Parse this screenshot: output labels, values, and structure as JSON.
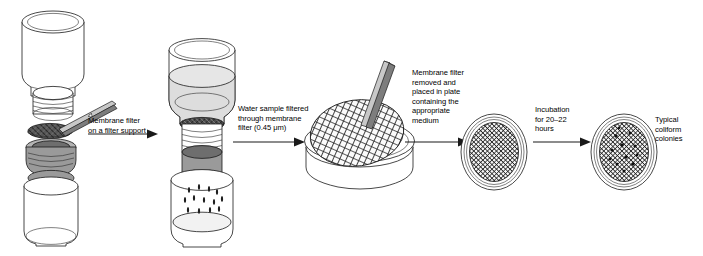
{
  "figure": {
    "background_color": "#ffffff",
    "ink_color": "#1a1a1a"
  },
  "labels": [
    {
      "id": "step-1-label",
      "text": "Membrane filter\non a filter support",
      "x": 88,
      "y": 116
    },
    {
      "id": "step-2-label",
      "text": "Water sample filtered\nthrough membrane\nfilter (0.45 μm)",
      "x": 238,
      "y": 104
    },
    {
      "id": "step-3-label",
      "text": "Membrane filter\nremoved and\nplaced in plate\ncontaining the\nappropriate\nmedium",
      "x": 412,
      "y": 68
    },
    {
      "id": "step-4-label",
      "text": "Incubation\nfor 20–22\nhours",
      "x": 535,
      "y": 105
    },
    {
      "id": "step-5-label",
      "text": "Typical\ncoliform\ncolonies",
      "x": 655,
      "y": 115
    }
  ],
  "stages": [
    {
      "id": "filtration-assembly-disassembled",
      "name": "Filter funnel, membrane filter and receiving flask, separated",
      "parts": [
        "upper-funnel",
        "threaded-neck",
        "membrane-filter-disc",
        "forceps",
        "filter-support-collar",
        "receiving-flask"
      ]
    },
    {
      "id": "filtration-assembly-assembled",
      "name": "Assembled apparatus with water sample being filtered",
      "parts": [
        "upper-funnel-with-sample",
        "membrane-filter-in-place",
        "threaded-neck",
        "support-collar",
        "receiving-flask-with-droplets"
      ]
    },
    {
      "id": "petri-dish-tilted",
      "name": "Membrane filter placed on medium in petri plate with forceps",
      "parts": [
        "petri-dish-base",
        "petri-dish-lid",
        "gridded-membrane",
        "forceps"
      ]
    },
    {
      "id": "petri-dish-incubating",
      "name": "Closed petri plate before incubation",
      "parts": [
        "petri-dish-rim",
        "gridded-membrane"
      ]
    },
    {
      "id": "petri-dish-colonies",
      "name": "Petri plate after incubation showing coliform colonies",
      "parts": [
        "petri-dish-rim",
        "gridded-membrane",
        "colonies"
      ]
    }
  ],
  "arrows": [
    {
      "id": "arrow-1",
      "from": "filtration-assembly-disassembled",
      "to": "filtration-assembly-assembled",
      "x": 88,
      "y": 134,
      "length": 68
    },
    {
      "id": "arrow-2",
      "from": "filtration-assembly-assembled",
      "to": "petri-dish-tilted",
      "x": 233,
      "y": 142,
      "length": 70
    },
    {
      "id": "arrow-3",
      "from": "petri-dish-tilted",
      "to": "petri-dish-incubating",
      "x": 405,
      "y": 142,
      "length": 62
    },
    {
      "id": "arrow-4",
      "from": "petri-dish-incubating",
      "to": "petri-dish-colonies",
      "x": 533,
      "y": 142,
      "length": 56
    }
  ],
  "colors": {
    "glass_outline": "#1a1a1a",
    "glass_fill": "#ffffff",
    "water_fill": "#d8d8d8",
    "collar_gray": "#9a9a9a",
    "collar_dark": "#6e6e6e",
    "membrane_dark": "#3a3a3a"
  }
}
